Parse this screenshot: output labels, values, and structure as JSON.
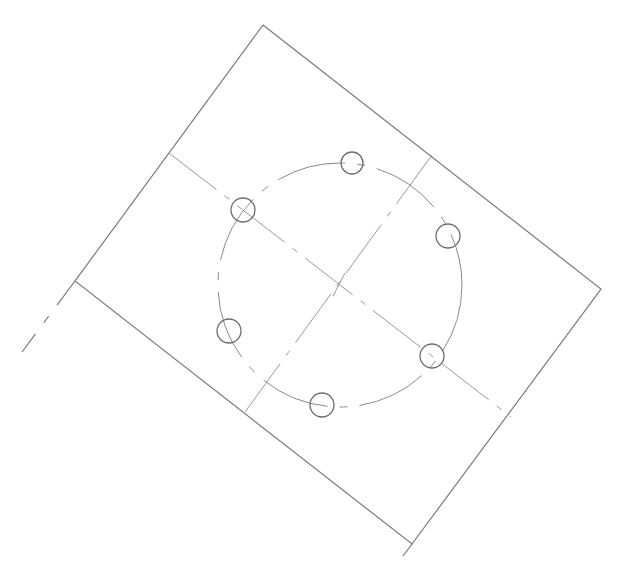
{
  "drawing": {
    "type": "technical-drawing",
    "description": "Rotated rectangular plate with bolt circle of six holes and centerlines",
    "plate_corners": [
      [
        263,
        25
      ],
      [
        601,
        289
      ],
      [
        412,
        544
      ],
      [
        75,
        281
      ]
    ],
    "plate_center": [
      340,
      285
    ],
    "bolt_circle_radius": 122,
    "hole_radius": 11,
    "holes": [
      {
        "id": 1,
        "cx": 352,
        "cy": 163
      },
      {
        "id": 2,
        "cx": 243,
        "cy": 210
      },
      {
        "id": 3,
        "cx": 448,
        "cy": 236
      },
      {
        "id": 4,
        "cx": 229,
        "cy": 331
      },
      {
        "id": 5,
        "cx": 432,
        "cy": 356
      },
      {
        "id": 6,
        "cx": 322,
        "cy": 405
      }
    ],
    "colors": {
      "line": "#7a7a7a",
      "background": "#ffffff"
    }
  }
}
